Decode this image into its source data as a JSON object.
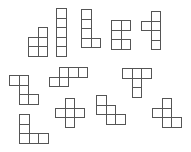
{
  "diagram": {
    "title": "",
    "cell_size": 9.5,
    "stroke_color": "#555555",
    "fill_color": "#ffffff",
    "shapes": [
      {
        "id": "shape-1",
        "name": "tall-square-pentomino",
        "origin": [
          28,
          27
        ],
        "cells": [
          [
            1,
            0
          ],
          [
            0,
            1
          ],
          [
            1,
            1
          ],
          [
            0,
            2
          ],
          [
            1,
            2
          ]
        ]
      },
      {
        "id": "shape-2",
        "name": "i-pentomino",
        "origin": [
          56,
          8
        ],
        "cells": [
          [
            0,
            0
          ],
          [
            0,
            1
          ],
          [
            0,
            2
          ],
          [
            0,
            3
          ],
          [
            0,
            4
          ]
        ]
      },
      {
        "id": "shape-3",
        "name": "l-pentomino",
        "origin": [
          81,
          9
        ],
        "cells": [
          [
            0,
            0
          ],
          [
            0,
            1
          ],
          [
            0,
            2
          ],
          [
            0,
            3
          ],
          [
            1,
            3
          ]
        ]
      },
      {
        "id": "shape-4",
        "name": "u-pentomino",
        "origin": [
          111,
          20
        ],
        "cells": [
          [
            0,
            0
          ],
          [
            1,
            0
          ],
          [
            0,
            1
          ],
          [
            0,
            2
          ],
          [
            1,
            2
          ]
        ]
      },
      {
        "id": "shape-5",
        "name": "y-pentomino",
        "origin": [
          141,
          11
        ],
        "cells": [
          [
            1,
            0
          ],
          [
            0,
            1
          ],
          [
            1,
            1
          ],
          [
            1,
            2
          ],
          [
            1,
            3
          ]
        ]
      },
      {
        "id": "shape-6",
        "name": "z-pentomino",
        "origin": [
          9,
          75
        ],
        "cells": [
          [
            0,
            0
          ],
          [
            1,
            0
          ],
          [
            1,
            1
          ],
          [
            1,
            2
          ],
          [
            2,
            2
          ]
        ]
      },
      {
        "id": "shape-7",
        "name": "n-pentomino",
        "origin": [
          49,
          67
        ],
        "cells": [
          [
            1,
            0
          ],
          [
            2,
            0
          ],
          [
            3,
            0
          ],
          [
            0,
            1
          ],
          [
            1,
            1
          ]
        ]
      },
      {
        "id": "shape-8",
        "name": "t-pentomino",
        "origin": [
          122,
          68
        ],
        "cells": [
          [
            0,
            0
          ],
          [
            1,
            0
          ],
          [
            2,
            0
          ],
          [
            1,
            1
          ],
          [
            1,
            2
          ]
        ]
      },
      {
        "id": "shape-9",
        "name": "v-pentomino",
        "origin": [
          19,
          114
        ],
        "cells": [
          [
            0,
            0
          ],
          [
            0,
            1
          ],
          [
            0,
            2
          ],
          [
            1,
            2
          ],
          [
            2,
            2
          ]
        ]
      },
      {
        "id": "shape-10",
        "name": "x-pentomino",
        "origin": [
          55,
          98
        ],
        "cells": [
          [
            1,
            0
          ],
          [
            0,
            1
          ],
          [
            1,
            1
          ],
          [
            2,
            1
          ],
          [
            1,
            2
          ]
        ]
      },
      {
        "id": "shape-11",
        "name": "w-pentomino",
        "origin": [
          96,
          95
        ],
        "cells": [
          [
            0,
            0
          ],
          [
            0,
            1
          ],
          [
            1,
            1
          ],
          [
            1,
            2
          ],
          [
            2,
            2
          ]
        ]
      },
      {
        "id": "shape-12",
        "name": "f-pentomino",
        "origin": [
          152,
          98
        ],
        "cells": [
          [
            1,
            0
          ],
          [
            0,
            1
          ],
          [
            1,
            1
          ],
          [
            1,
            2
          ],
          [
            2,
            2
          ]
        ]
      }
    ]
  }
}
